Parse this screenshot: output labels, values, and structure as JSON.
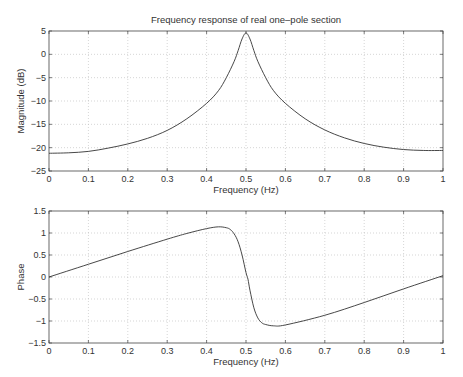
{
  "chart_data": [
    {
      "type": "line",
      "title": "Frequency response of real one–pole section",
      "xlabel": "Frequency (Hz)",
      "ylabel": "Magnitude (dB)",
      "xlim": [
        0,
        1
      ],
      "ylim": [
        -25,
        5
      ],
      "xticks": [
        "0",
        "0.1",
        "0.2",
        "0.3",
        "0.4",
        "0.5",
        "0.6",
        "0.7",
        "0.8",
        "0.9",
        "1"
      ],
      "yticks": [
        "5",
        "0",
        "−5",
        "−10",
        "−15",
        "−20",
        "−25"
      ],
      "grid": true,
      "x": [
        0,
        0.05,
        0.1,
        0.15,
        0.2,
        0.25,
        0.3,
        0.35,
        0.4,
        0.43,
        0.45,
        0.47,
        0.48,
        0.49,
        0.5,
        0.51,
        0.52,
        0.53,
        0.55,
        0.57,
        0.6,
        0.65,
        0.7,
        0.75,
        0.8,
        0.85,
        0.9,
        0.95,
        1
      ],
      "values": [
        -21.2,
        -21.1,
        -20.8,
        -20.1,
        -19.2,
        -18,
        -16.3,
        -13.8,
        -10.5,
        -7.8,
        -5,
        -1.5,
        0.8,
        3.3,
        4.6,
        3.3,
        0.8,
        -1.5,
        -5,
        -7.8,
        -10.5,
        -13.8,
        -16.2,
        -17.9,
        -19.1,
        -19.9,
        -20.4,
        -20.6,
        -20.6
      ]
    },
    {
      "type": "line",
      "title": "",
      "xlabel": "Frequency (Hz)",
      "ylabel": "Phase",
      "xlim": [
        0,
        1
      ],
      "ylim": [
        -1.5,
        1.5
      ],
      "xticks": [
        "0",
        "0.1",
        "0.2",
        "0.3",
        "0.4",
        "0.5",
        "0.6",
        "0.7",
        "0.8",
        "0.9",
        "1"
      ],
      "yticks": [
        "1.5",
        "1",
        "0.5",
        "0",
        "−0.5",
        "−1",
        "−1.5"
      ],
      "grid": true,
      "x": [
        0,
        0.1,
        0.2,
        0.3,
        0.35,
        0.4,
        0.43,
        0.45,
        0.46,
        0.47,
        0.48,
        0.49,
        0.5,
        0.505,
        0.51,
        0.52,
        0.53,
        0.54,
        0.55,
        0.57,
        0.6,
        0.7,
        0.8,
        0.9,
        1
      ],
      "values": [
        0,
        0.29,
        0.58,
        0.86,
        0.99,
        1.1,
        1.14,
        1.12,
        1.08,
        0.98,
        0.8,
        0.5,
        0.1,
        -0.05,
        -0.3,
        -0.7,
        -0.93,
        -1.04,
        -1.08,
        -1.11,
        -1.09,
        -0.87,
        -0.58,
        -0.27,
        0.03
      ]
    }
  ]
}
